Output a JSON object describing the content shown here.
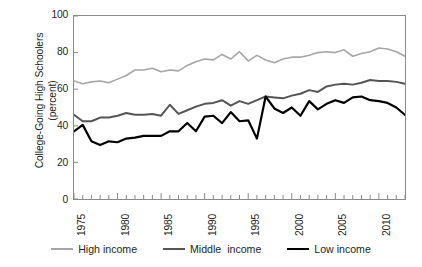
{
  "chart_data": {
    "type": "line",
    "title": "",
    "xlabel": "",
    "ylabel": "College-Going High Schoolers (percent)",
    "ylabel_line1": "College-Going High Schoolers",
    "ylabel_line2": "(percent)",
    "ylim": [
      0,
      100
    ],
    "xlim": [
      1975,
      2013
    ],
    "yticks": [
      0,
      20,
      40,
      60,
      80,
      100
    ],
    "ytick_labels": [
      "0",
      "20",
      "40",
      "60",
      "80",
      "100"
    ],
    "xticks_major": [
      1975,
      1980,
      1985,
      1990,
      1995,
      2000,
      2005,
      2010
    ],
    "xtick_labels": [
      "1975",
      "1980",
      "1985",
      "1990",
      "1995",
      "2000",
      "2005",
      "2010"
    ],
    "xtick_minor_step": 1,
    "grid": false,
    "legend_position": "bottom",
    "x": [
      1975,
      1976,
      1977,
      1978,
      1979,
      1980,
      1981,
      1982,
      1983,
      1984,
      1985,
      1986,
      1987,
      1988,
      1989,
      1990,
      1991,
      1992,
      1993,
      1994,
      1995,
      1996,
      1997,
      1998,
      1999,
      2000,
      2001,
      2002,
      2003,
      2004,
      2005,
      2006,
      2007,
      2008,
      2009,
      2010,
      2011,
      2012,
      2013
    ],
    "series": [
      {
        "name": "High income",
        "color": "#a6a6a6",
        "width": 1.6,
        "values": [
          64.5,
          63.0,
          64.0,
          64.5,
          63.5,
          65.5,
          67.5,
          70.5,
          70.5,
          71.5,
          69.5,
          70.5,
          70.0,
          73.0,
          75.0,
          76.5,
          76.0,
          79.0,
          76.5,
          80.5,
          75.5,
          78.5,
          76.0,
          74.5,
          76.5,
          77.5,
          77.5,
          78.5,
          80.0,
          80.5,
          80.0,
          81.5,
          78.0,
          79.5,
          80.5,
          82.5,
          82.0,
          80.5,
          78.0
        ]
      },
      {
        "name": "Middle  income",
        "color": "#555555",
        "width": 2.0,
        "values": [
          46.0,
          42.5,
          42.5,
          44.5,
          44.5,
          45.5,
          47.0,
          46.0,
          46.0,
          46.5,
          45.5,
          51.5,
          46.5,
          48.5,
          50.5,
          52.0,
          52.5,
          54.0,
          51.0,
          53.5,
          52.0,
          54.0,
          56.0,
          55.5,
          55.0,
          56.5,
          57.5,
          59.5,
          58.5,
          61.5,
          62.5,
          63.0,
          62.5,
          63.5,
          65.0,
          64.5,
          64.5,
          64.0,
          63.0
        ]
      },
      {
        "name": "Low income",
        "color": "#000000",
        "width": 2.2,
        "values": [
          37.0,
          40.5,
          31.5,
          29.5,
          31.5,
          31.0,
          33.0,
          33.5,
          34.5,
          34.5,
          34.5,
          37.0,
          37.0,
          41.5,
          37.0,
          45.0,
          45.5,
          41.5,
          47.5,
          42.5,
          43.0,
          33.0,
          56.0,
          49.5,
          47.0,
          50.0,
          45.5,
          53.5,
          49.0,
          52.0,
          54.0,
          52.5,
          55.5,
          56.0,
          54.0,
          53.5,
          52.5,
          50.0,
          46.0
        ]
      }
    ],
    "legend_entries": [
      {
        "label": "High income",
        "color": "#a6a6a6"
      },
      {
        "label": "Middle  income",
        "color": "#555555"
      },
      {
        "label": "Low income",
        "color": "#000000"
      }
    ]
  }
}
